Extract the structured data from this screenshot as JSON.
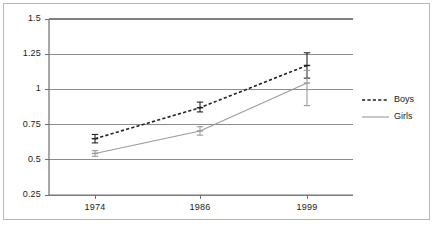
{
  "chart_data": {
    "type": "line",
    "title": "",
    "xlabel": "",
    "ylabel": "",
    "categories": [
      "1974",
      "1986",
      "1999"
    ],
    "xtick_labels": [
      "1974",
      "1986",
      "1999"
    ],
    "ytick_labels": [
      "0.25",
      "0.5",
      "0.75",
      "1",
      "1.25",
      "1.5"
    ],
    "ytick_values": [
      0.25,
      0.5,
      0.75,
      1,
      1.25,
      1.5
    ],
    "ylim": [
      0.25,
      1.5
    ],
    "grid": "horizontal",
    "legend_position": "right",
    "series": [
      {
        "name": "Boys",
        "label": "Boys",
        "style": "dashed",
        "color": "#222222",
        "values": [
          0.65,
          0.87,
          1.17
        ],
        "error_low": [
          0.62,
          0.84,
          1.08
        ],
        "error_high": [
          0.68,
          0.91,
          1.26
        ]
      },
      {
        "name": "Girls",
        "label": "Girls",
        "style": "solid",
        "color": "#9a9a9a",
        "values": [
          0.545,
          0.705,
          1.045
        ],
        "error_low": [
          0.525,
          0.675,
          0.885
        ],
        "error_high": [
          0.565,
          0.735,
          1.135
        ]
      }
    ]
  },
  "legend": {
    "items": [
      {
        "label": "Boys"
      },
      {
        "label": "Girls"
      }
    ]
  },
  "colors": {
    "boys": "#222222",
    "girls": "#9a9a9a",
    "grid": "#808080",
    "axis": "#6e6e6e",
    "frame": "#b9b9b9",
    "background": "#ffffff"
  }
}
